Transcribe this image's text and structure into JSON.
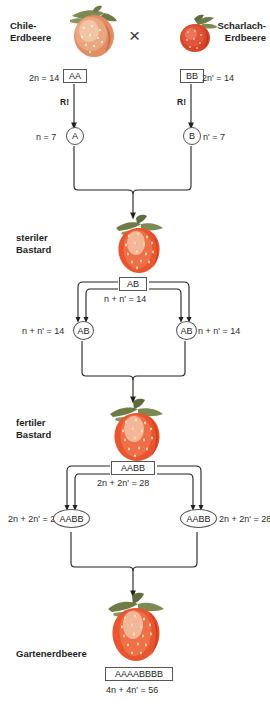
{
  "diagram": {
    "title_kind": "strawberry-polyploidy-cross-diagram",
    "parents": {
      "left": {
        "name": "Chile-\nErdbeere",
        "ploidy_text": "2n = 14",
        "genotype": "AA",
        "meiosis_label": "R!",
        "gamete_ploidy": "n = 7",
        "gamete_genotype": "A"
      },
      "right": {
        "name": "Scharlach-\nErdbeere",
        "ploidy_text": "2n' = 14",
        "genotype": "BB",
        "meiosis_label": "R!",
        "gamete_ploidy": "n' = 7",
        "gamete_genotype": "B"
      },
      "cross_symbol": "×"
    },
    "generations": [
      {
        "label": "steriler\nBastard",
        "genotype_box": "AB",
        "genotype_box_ploidy": "n + n' = 14",
        "gametes": [
          {
            "side": "left",
            "ploidy": "n + n' = 14",
            "genotype": "AB"
          },
          {
            "side": "right",
            "ploidy": "n + n' = 14",
            "genotype": "AB"
          }
        ]
      },
      {
        "label": "fertiler\nBastard",
        "genotype_box": "AABB",
        "genotype_box_ploidy": "2n + 2n' = 28",
        "gametes": [
          {
            "side": "left",
            "ploidy": "2n + 2n' = 28",
            "genotype": "AABB"
          },
          {
            "side": "right",
            "ploidy": "2n + 2n' = 28",
            "genotype": "AABB"
          }
        ]
      }
    ],
    "result": {
      "label": "Gartenerdbeere",
      "genotype_box": "AAAABBBB",
      "ploidy_text": "4n + 4n' = 56"
    },
    "colors": {
      "line": "#231f20",
      "text": "#231f20",
      "berry_body": "#e8552f",
      "berry_light": "#f2b9a0",
      "berry_calyx": "#6e7f४2",
      "box_border": "#555555"
    }
  }
}
